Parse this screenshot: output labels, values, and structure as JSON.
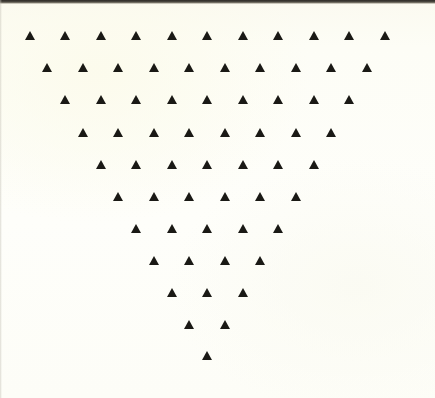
{
  "figure": {
    "medium": "scanned page",
    "background_color": "#fdfdf5",
    "glyph_color": "#1a1915",
    "scan_edge_color": "#2e2c27",
    "glyph_name": "filled-up-triangle",
    "glyph_char": "▲",
    "total_glyphs": 66,
    "row_count": 11,
    "canvas": {
      "width": 435,
      "height": 398
    }
  },
  "chart_data": {
    "type": "scatter",
    "subtitle": "",
    "xlabel": "",
    "ylabel": "",
    "xlim": [
      0,
      435
    ],
    "ylim": [
      0,
      398
    ],
    "grid": false,
    "legend": "none",
    "marker": "triangle-up",
    "marker_color": "#1a1915",
    "marker_width": 11,
    "marker_height": 9.5,
    "layout": {
      "pattern": "inverted-triangle",
      "rows": 11,
      "row_counts": [
        11,
        10,
        9,
        8,
        7,
        6,
        5,
        4,
        3,
        2,
        1
      ],
      "total_markers": 66,
      "x_spacing": 35.5,
      "y_spacing": 32.2,
      "row_offset_x": 17.75,
      "first_row_start_x": 30,
      "first_row_y": 31
    },
    "rows": [
      {
        "index": 1,
        "count": 11,
        "y": 31,
        "x": [
          30.0,
          65.5,
          101.0,
          136.5,
          172.0,
          207.5,
          243.0,
          278.5,
          314.0,
          349.5,
          385.0
        ]
      },
      {
        "index": 2,
        "count": 10,
        "y": 63,
        "x": [
          47.8,
          83.3,
          118.8,
          154.3,
          189.8,
          225.3,
          260.8,
          296.3,
          331.8,
          367.3
        ]
      },
      {
        "index": 3,
        "count": 9,
        "y": 95,
        "x": [
          65.5,
          101.0,
          136.5,
          172.0,
          207.5,
          243.0,
          278.5,
          314.0,
          349.5
        ]
      },
      {
        "index": 4,
        "count": 8,
        "y": 128,
        "x": [
          83.3,
          118.8,
          154.3,
          189.8,
          225.3,
          260.8,
          296.3,
          331.8
        ]
      },
      {
        "index": 5,
        "count": 7,
        "y": 160,
        "x": [
          101.0,
          136.5,
          172.0,
          207.5,
          243.0,
          278.5,
          314.0
        ]
      },
      {
        "index": 6,
        "count": 6,
        "y": 192,
        "x": [
          118.8,
          154.3,
          189.8,
          225.3,
          260.8,
          296.3
        ]
      },
      {
        "index": 7,
        "count": 5,
        "y": 224,
        "x": [
          136.5,
          172.0,
          207.5,
          243.0,
          278.5
        ]
      },
      {
        "index": 8,
        "count": 4,
        "y": 256,
        "x": [
          154.3,
          189.8,
          225.3,
          260.8
        ]
      },
      {
        "index": 9,
        "count": 3,
        "y": 288,
        "x": [
          172.0,
          207.5,
          243.0
        ]
      },
      {
        "index": 10,
        "count": 2,
        "y": 320,
        "x": [
          189.8,
          225.3
        ]
      },
      {
        "index": 11,
        "count": 1,
        "y": 351,
        "x": [
          207.5
        ]
      }
    ]
  }
}
